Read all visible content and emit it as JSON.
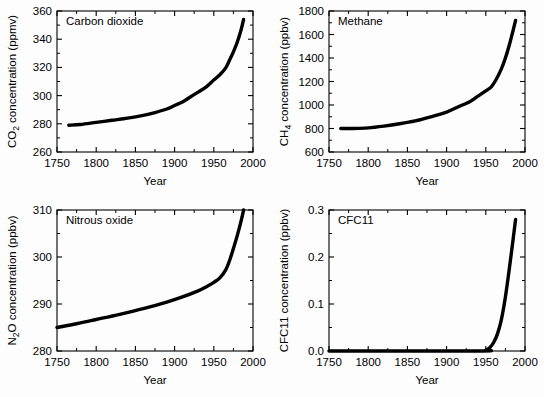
{
  "figure": {
    "background": "#fdfdfd",
    "line_color": "#000000",
    "axis_color": "#000000",
    "panel_count": 4
  },
  "shared": {
    "xlabel": "Year",
    "x_ticks": [
      1750,
      1800,
      1850,
      1900,
      1950,
      2000
    ],
    "x_tick_labels": [
      "1750",
      "1800",
      "1850",
      "1900",
      "1950",
      "2000"
    ],
    "xlim": [
      1750,
      2000
    ],
    "x_minor_interval": 25
  },
  "chart_data": [
    {
      "id": "co2",
      "type": "line",
      "title": "Carbon dioxide",
      "panel_label": "Carbon dioxide",
      "xlabel": "Year",
      "ylabel": "CO2 concentration (ppmv)",
      "ylabel_parts": {
        "pre": "CO",
        "sub": "2",
        "post": " concentration (ppmv)"
      },
      "xlim": [
        1750,
        2000
      ],
      "ylim": [
        260,
        360
      ],
      "y_ticks": [
        260,
        280,
        300,
        320,
        340,
        360
      ],
      "y_tick_labels": [
        "260",
        "280",
        "300",
        "320",
        "340",
        "360"
      ],
      "y_minor_interval": 10,
      "grid": false,
      "legend": "none",
      "units": "ppmv",
      "x": [
        1765,
        1780,
        1800,
        1820,
        1840,
        1860,
        1875,
        1890,
        1900,
        1910,
        1920,
        1930,
        1940,
        1950,
        1958,
        1965,
        1970,
        1975,
        1980,
        1985,
        1988
      ],
      "values": [
        279,
        279.5,
        281,
        282.5,
        284,
        286,
        288,
        290.5,
        293,
        295.5,
        299,
        302.5,
        306,
        311,
        315,
        319.5,
        325,
        331,
        338,
        347,
        354
      ]
    },
    {
      "id": "ch4",
      "type": "line",
      "title": "Methane",
      "panel_label": "Methane",
      "xlabel": "Year",
      "ylabel": "CH4 concentration (ppbv)",
      "ylabel_parts": {
        "pre": "CH",
        "sub": "4",
        "post": " concentration (ppbv)"
      },
      "xlim": [
        1750,
        2000
      ],
      "ylim": [
        600,
        1800
      ],
      "y_ticks": [
        600,
        800,
        1000,
        1200,
        1400,
        1600,
        1800
      ],
      "y_tick_labels": [
        "600",
        "800",
        "1000",
        "1200",
        "1400",
        "1600",
        "1800"
      ],
      "y_minor_interval": 100,
      "grid": false,
      "legend": "none",
      "units": "ppbv",
      "x": [
        1765,
        1780,
        1800,
        1820,
        1840,
        1860,
        1880,
        1900,
        1915,
        1930,
        1940,
        1950,
        1957,
        1963,
        1970,
        1975,
        1980,
        1985,
        1988
      ],
      "values": [
        800,
        800,
        805,
        820,
        840,
        865,
        900,
        940,
        985,
        1030,
        1075,
        1120,
        1155,
        1215,
        1310,
        1400,
        1510,
        1640,
        1720
      ]
    },
    {
      "id": "n2o",
      "type": "line",
      "title": "Nitrous oxide",
      "panel_label": "Nitrous oxide",
      "xlabel": "Year",
      "ylabel": "N2O concentration (ppbv)",
      "ylabel_parts": {
        "pre": "N",
        "sub": "2",
        "post": "O concentration (ppbv)"
      },
      "xlim": [
        1750,
        2000
      ],
      "ylim": [
        280,
        310
      ],
      "y_ticks": [
        280,
        290,
        300,
        310
      ],
      "y_tick_labels": [
        "280",
        "290",
        "300",
        "310"
      ],
      "y_minor_interval": 5,
      "grid": false,
      "legend": "none",
      "units": "ppbv",
      "x": [
        1750,
        1775,
        1800,
        1830,
        1860,
        1890,
        1910,
        1930,
        1940,
        1950,
        1958,
        1965,
        1970,
        1975,
        1980,
        1985,
        1988
      ],
      "values": [
        285,
        285.8,
        286.7,
        287.8,
        289.0,
        290.4,
        291.5,
        292.8,
        293.6,
        294.6,
        295.6,
        297.2,
        299.2,
        301.8,
        304.6,
        307.8,
        310
      ]
    },
    {
      "id": "cfc11",
      "type": "line",
      "title": "CFC11",
      "panel_label": "CFC11",
      "xlabel": "Year",
      "ylabel": "CFC11 concentration (ppbv)",
      "ylabel_parts": {
        "pre": "CFC11 concentration (ppbv)",
        "sub": "",
        "post": ""
      },
      "xlim": [
        1750,
        2000
      ],
      "ylim": [
        0.0,
        0.3
      ],
      "y_ticks": [
        0.0,
        0.1,
        0.2,
        0.3
      ],
      "y_tick_labels": [
        "0.0",
        "0.1",
        "0.2",
        "0.3"
      ],
      "y_minor_interval": 0.05,
      "grid": false,
      "legend": "none",
      "units": "ppbv",
      "x": [
        1750,
        1940,
        1950,
        1955,
        1960,
        1965,
        1970,
        1975,
        1980,
        1985,
        1988
      ],
      "values": [
        0.0,
        0.0,
        0.002,
        0.007,
        0.018,
        0.037,
        0.068,
        0.115,
        0.175,
        0.24,
        0.28
      ]
    }
  ]
}
